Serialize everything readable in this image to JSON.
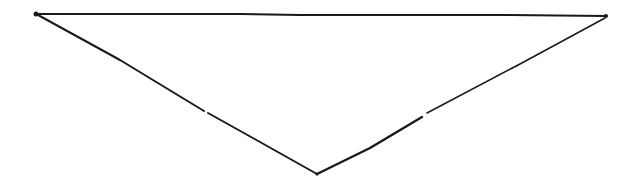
{
  "diagram": {
    "shape": "inverted-triangle",
    "stroke_color": "#1a1a1a",
    "background": "#ffffff",
    "vertices": {
      "top_left": [
        36,
        14
      ],
      "top_right": [
        606,
        16
      ],
      "bottom": [
        317,
        174
      ]
    },
    "segments": [
      {
        "name": "top-edge",
        "points": "36,14 120,14 240,14 300,15 380,15 500,15 606,16"
      },
      {
        "name": "left-edge-upper",
        "points": "38,15 120,60 204,111"
      },
      {
        "name": "left-edge-lower",
        "points": "208,113 260,142 317,174"
      },
      {
        "name": "right-edge-lower",
        "points": "317,174 370,148 422,117"
      },
      {
        "name": "right-edge-upper",
        "points": "427,113 520,64 605,18"
      }
    ]
  }
}
